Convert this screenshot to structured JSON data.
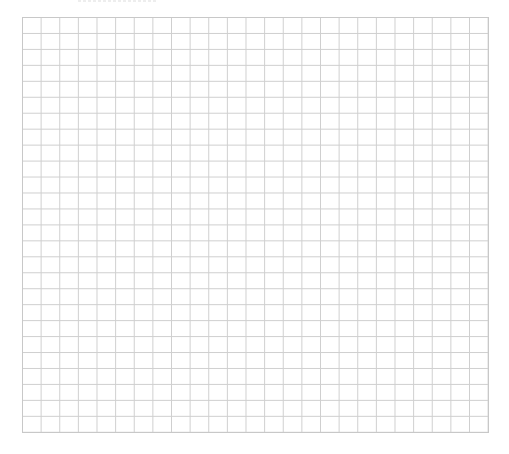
{
  "grid": {
    "columns": 25,
    "rows": 26,
    "line_color": "#cfcfcf",
    "border_color": "#c8c8c8",
    "background_color": "#ffffff"
  }
}
